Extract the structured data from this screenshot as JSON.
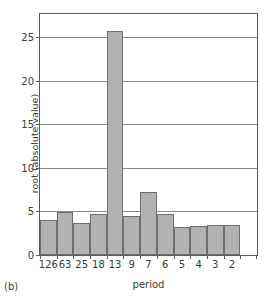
{
  "panel": {
    "tag": "(b)"
  },
  "chart_data": {
    "type": "bar",
    "title": "",
    "xlabel": "period",
    "ylabel": "root (absolute value)",
    "categories": [
      "126",
      "63",
      "25",
      "18",
      "13",
      "9",
      "7",
      "6",
      "5",
      "4",
      "3",
      "2"
    ],
    "values": [
      4.0,
      5.0,
      3.65,
      4.7,
      25.7,
      4.45,
      7.3,
      4.7,
      3.2,
      3.3,
      3.45,
      3.5
    ],
    "ylim": [
      0,
      27.7
    ],
    "yticks": [
      0,
      5,
      10,
      15,
      20,
      25
    ],
    "ytick_labels": [
      "0",
      "5",
      "10",
      "15",
      "20",
      "25"
    ],
    "grid": "horizontal",
    "legend": "none",
    "bar_color": "#b2b2b2",
    "bar_edge_color": "#6e6e6e",
    "axis_color": "#5a5a5a",
    "grid_color": "#8a8a8a",
    "n_slots": 13,
    "bars_filled": 12
  }
}
